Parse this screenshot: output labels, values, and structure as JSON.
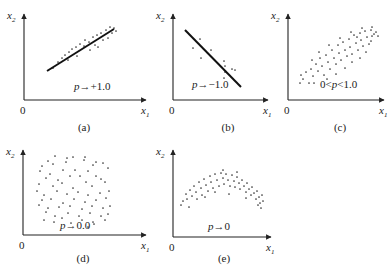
{
  "figure": {
    "panels": [
      {
        "id": "a",
        "caption": "(a)",
        "annotation": "p→+1.0",
        "x_label": "x",
        "x_sub": "1",
        "y_label": "x",
        "y_sub": "2",
        "origin_label": "0",
        "origin": [
          24,
          100
        ],
        "x_end": 146,
        "y_top": 14,
        "caption_pos": [
          84,
          131
        ],
        "annotation_pos": [
          74,
          90
        ],
        "line": [
          [
            47,
            71
          ],
          [
            114,
            29
          ]
        ],
        "points": [
          [
            53,
            68
          ],
          [
            58,
            62
          ],
          [
            62,
            58
          ],
          [
            65,
            55
          ],
          [
            69,
            52
          ],
          [
            68,
            60
          ],
          [
            72,
            49
          ],
          [
            76,
            47
          ],
          [
            77,
            56
          ],
          [
            80,
            44
          ],
          [
            84,
            46
          ],
          [
            85,
            40
          ],
          [
            89,
            42
          ],
          [
            90,
            50
          ],
          [
            93,
            37
          ],
          [
            95,
            45
          ],
          [
            97,
            35
          ],
          [
            98,
            47
          ],
          [
            101,
            33
          ],
          [
            103,
            40
          ],
          [
            106,
            30
          ],
          [
            108,
            38
          ],
          [
            110,
            27
          ],
          [
            112,
            33
          ],
          [
            114,
            28
          ],
          [
            116,
            31
          ]
        ]
      },
      {
        "id": "b",
        "caption": "(b)",
        "annotation": "p→−1.0",
        "x_label": "x",
        "x_sub": "1",
        "y_label": "x",
        "y_sub": "2",
        "origin_label": "0",
        "origin": [
          173,
          100
        ],
        "x_end": 268,
        "y_top": 14,
        "caption_pos": [
          228,
          131
        ],
        "annotation_pos": [
          192,
          88
        ],
        "line": [
          [
            185,
            30
          ],
          [
            241,
            87
          ]
        ],
        "points": [
          [
            200,
            39
          ],
          [
            193,
            48
          ],
          [
            201,
            58
          ],
          [
            211,
            50
          ],
          [
            224,
            61
          ],
          [
            225,
            66
          ],
          [
            225,
            72
          ],
          [
            232,
            69
          ],
          [
            235,
            70
          ],
          [
            224,
            78
          ]
        ]
      },
      {
        "id": "c",
        "caption": "(c)",
        "annotation": "0<p<1.0",
        "x_label": "x",
        "x_sub": "1",
        "y_label": "x",
        "y_sub": "2",
        "origin_label": "0",
        "origin": [
          288,
          100
        ],
        "x_end": 384,
        "y_top": 14,
        "caption_pos": [
          340,
          131
        ],
        "annotation_pos": [
          320,
          88
        ],
        "points": [
          [
            300,
            83
          ],
          [
            303,
            79
          ],
          [
            301,
            75
          ],
          [
            306,
            72
          ],
          [
            309,
            83
          ],
          [
            311,
            69
          ],
          [
            313,
            76
          ],
          [
            316,
            64
          ],
          [
            314,
            83
          ],
          [
            318,
            71
          ],
          [
            320,
            58
          ],
          [
            322,
            66
          ],
          [
            324,
            75
          ],
          [
            326,
            55
          ],
          [
            328,
            62
          ],
          [
            330,
            69
          ],
          [
            332,
            50
          ],
          [
            334,
            58
          ],
          [
            336,
            64
          ],
          [
            338,
            45
          ],
          [
            339,
            53
          ],
          [
            341,
            60
          ],
          [
            343,
            42
          ],
          [
            345,
            50
          ],
          [
            347,
            56
          ],
          [
            349,
            39
          ],
          [
            350,
            47
          ],
          [
            352,
            54
          ],
          [
            354,
            35
          ],
          [
            356,
            43
          ],
          [
            358,
            50
          ],
          [
            360,
            33
          ],
          [
            361,
            40
          ],
          [
            363,
            46
          ],
          [
            365,
            31
          ],
          [
            367,
            37
          ],
          [
            369,
            44
          ],
          [
            371,
            30
          ],
          [
            372,
            36
          ],
          [
            374,
            34
          ],
          [
            376,
            32
          ],
          [
            378,
            36
          ],
          [
            345,
            68
          ],
          [
            336,
            74
          ],
          [
            327,
            79
          ],
          [
            352,
            62
          ],
          [
            360,
            58
          ],
          [
            357,
            37
          ],
          [
            366,
            52
          ],
          [
            371,
            41
          ],
          [
            312,
            60
          ],
          [
            319,
            52
          ],
          [
            329,
            45
          ],
          [
            340,
            38
          ],
          [
            351,
            32
          ],
          [
            362,
            28
          ],
          [
            372,
            27
          ]
        ]
      },
      {
        "id": "d",
        "caption": "(d)",
        "annotation": "p→0.0",
        "x_label": "x",
        "x_sub": "1",
        "y_label": "x",
        "y_sub": "2",
        "origin_label": "0",
        "origin": [
          23,
          235
        ],
        "x_end": 146,
        "y_top": 150,
        "caption_pos": [
          83,
          262
        ],
        "annotation_pos": [
          60,
          229
        ],
        "points": [
          [
            55,
            156
          ],
          [
            67,
            158
          ],
          [
            73,
            157
          ],
          [
            85,
            157
          ],
          [
            48,
            161
          ],
          [
            66,
            162
          ],
          [
            84,
            160
          ],
          [
            96,
            162
          ],
          [
            42,
            166
          ],
          [
            53,
            164
          ],
          [
            93,
            165
          ],
          [
            103,
            163
          ],
          [
            40,
            171
          ],
          [
            50,
            174
          ],
          [
            63,
            170
          ],
          [
            75,
            170
          ],
          [
            88,
            171
          ],
          [
            108,
            168
          ],
          [
            46,
            178
          ],
          [
            58,
            180
          ],
          [
            70,
            176
          ],
          [
            80,
            176
          ],
          [
            96,
            176
          ],
          [
            101,
            179
          ],
          [
            39,
            184
          ],
          [
            53,
            186
          ],
          [
            62,
            183
          ],
          [
            73,
            188
          ],
          [
            86,
            182
          ],
          [
            92,
            186
          ],
          [
            105,
            182
          ],
          [
            37,
            191
          ],
          [
            44,
            195
          ],
          [
            57,
            191
          ],
          [
            67,
            194
          ],
          [
            78,
            192
          ],
          [
            88,
            195
          ],
          [
            100,
            193
          ],
          [
            109,
            191
          ],
          [
            42,
            200
          ],
          [
            51,
            199
          ],
          [
            63,
            203
          ],
          [
            74,
            199
          ],
          [
            85,
            202
          ],
          [
            96,
            200
          ],
          [
            106,
            198
          ],
          [
            39,
            205
          ],
          [
            48,
            208
          ],
          [
            59,
            207
          ],
          [
            70,
            206
          ],
          [
            82,
            209
          ],
          [
            92,
            206
          ],
          [
            103,
            208
          ],
          [
            110,
            206
          ],
          [
            46,
            212
          ],
          [
            55,
            216
          ],
          [
            68,
            213
          ],
          [
            79,
            216
          ],
          [
            90,
            213
          ],
          [
            101,
            216
          ],
          [
            108,
            214
          ],
          [
            44,
            220
          ],
          [
            54,
            222
          ],
          [
            62,
            218
          ],
          [
            71,
            223
          ],
          [
            82,
            220
          ],
          [
            93,
            222
          ],
          [
            105,
            220
          ],
          [
            88,
            227
          ],
          [
            94,
            224
          ]
        ]
      },
      {
        "id": "e",
        "caption": "(e)",
        "annotation": "p→0",
        "x_label": "x",
        "x_sub": "1",
        "y_label": "x",
        "y_sub": "2",
        "origin_label": "0",
        "origin": [
          173,
          237
        ],
        "x_end": 271,
        "y_top": 150,
        "caption_pos": [
          224,
          262
        ],
        "annotation_pos": [
          208,
          230
        ],
        "points": [
          [
            181,
            205
          ],
          [
            183,
            201
          ],
          [
            187,
            199
          ],
          [
            186,
            194
          ],
          [
            189,
            207
          ],
          [
            190,
            190
          ],
          [
            192,
            196
          ],
          [
            194,
            186
          ],
          [
            196,
            192
          ],
          [
            197,
            199
          ],
          [
            199,
            182
          ],
          [
            201,
            188
          ],
          [
            202,
            195
          ],
          [
            204,
            179
          ],
          [
            206,
            185
          ],
          [
            208,
            191
          ],
          [
            210,
            176
          ],
          [
            211,
            182
          ],
          [
            213,
            188
          ],
          [
            215,
            174
          ],
          [
            217,
            180
          ],
          [
            219,
            186
          ],
          [
            221,
            173
          ],
          [
            223,
            178
          ],
          [
            224,
            184
          ],
          [
            226,
            174
          ],
          [
            228,
            180
          ],
          [
            230,
            186
          ],
          [
            232,
            175
          ],
          [
            234,
            181
          ],
          [
            235,
            187
          ],
          [
            237,
            177
          ],
          [
            239,
            183
          ],
          [
            240,
            189
          ],
          [
            242,
            180
          ],
          [
            244,
            186
          ],
          [
            246,
            192
          ],
          [
            247,
            183
          ],
          [
            249,
            189
          ],
          [
            251,
            195
          ],
          [
            252,
            187
          ],
          [
            254,
            193
          ],
          [
            256,
            199
          ],
          [
            257,
            191
          ],
          [
            259,
            197
          ],
          [
            260,
            203
          ],
          [
            262,
            195
          ],
          [
            263,
            201
          ],
          [
            261,
            208
          ],
          [
            258,
            205
          ],
          [
            229,
            194
          ],
          [
            205,
            197
          ],
          [
            215,
            192
          ],
          [
            246,
            198
          ],
          [
            223,
            170
          ],
          [
            237,
            172
          ]
        ]
      }
    ]
  }
}
